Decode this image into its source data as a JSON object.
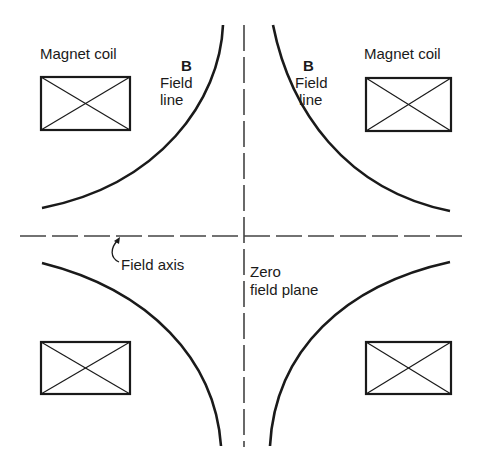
{
  "diagram": {
    "type": "quadrupole magnet field schematic",
    "colors": {
      "ink": "#1a1a1a",
      "dashed": "#444444",
      "background": "#ffffff"
    },
    "coils": [
      {
        "id": "top-left",
        "label": "Magnet coil"
      },
      {
        "id": "top-right",
        "label": "Magnet coil"
      },
      {
        "id": "bottom-left",
        "label": ""
      },
      {
        "id": "bottom-right",
        "label": ""
      }
    ],
    "field_lines": [
      {
        "id": "top-left",
        "symbol": "B",
        "label_line1": "Field",
        "label_line2": "line"
      },
      {
        "id": "top-right",
        "symbol": "B",
        "label_line1": "Field",
        "label_line2": "line"
      },
      {
        "id": "bottom-left"
      },
      {
        "id": "bottom-right"
      }
    ],
    "axes": {
      "horizontal_label": "Field axis",
      "vertical_label_line1": "Zero",
      "vertical_label_line2": "field plane"
    }
  }
}
